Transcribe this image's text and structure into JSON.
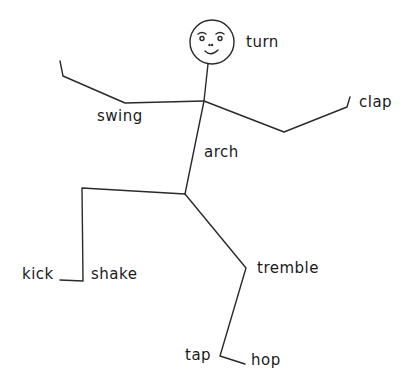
{
  "diagram": {
    "type": "stick-figure-action-words",
    "stroke_color": "#2a2a2a",
    "text_color": "#1a1a1a",
    "background": "#ffffff",
    "labels": {
      "turn": "turn",
      "swing": "swing",
      "clap": "clap",
      "arch": "arch",
      "kick": "kick",
      "shake": "shake",
      "tremble": "tremble",
      "tap": "tap",
      "hop": "hop"
    },
    "body_parts": [
      {
        "part": "head",
        "action": "turn"
      },
      {
        "part": "left-arm",
        "action": "swing"
      },
      {
        "part": "right-hand",
        "action": "clap"
      },
      {
        "part": "back",
        "action": "arch"
      },
      {
        "part": "left-foot",
        "action": "kick"
      },
      {
        "part": "left-leg",
        "action": "shake"
      },
      {
        "part": "right-knee",
        "action": "tremble"
      },
      {
        "part": "right-toe",
        "action": "tap"
      },
      {
        "part": "right-foot",
        "action": "hop"
      }
    ]
  }
}
